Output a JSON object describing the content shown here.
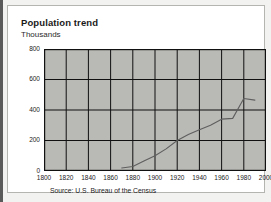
{
  "card": {
    "title": "Population trend",
    "subtitle": "Thousands",
    "source": "Source: U.S. Bureau of the Census"
  },
  "colors": {
    "plot_background": "#b9b9b6",
    "card_background": "#ffffff",
    "page_background": "#f2f2f0",
    "axis": "#111111",
    "grid": "#111111",
    "line": "#5f5f5f",
    "text": "#1a1a1a",
    "left_rule": "#5a5a5a"
  },
  "chart_data": {
    "type": "line",
    "title": "Population trend",
    "subtitle": "Thousands",
    "xlabel": "",
    "ylabel": "Thousands",
    "xlim": [
      1800,
      2000
    ],
    "ylim": [
      0,
      800
    ],
    "xticks": [
      1800,
      1820,
      1840,
      1860,
      1880,
      1900,
      1920,
      1940,
      1960,
      1980,
      2000
    ],
    "yticks": [
      0,
      200,
      400,
      600,
      800
    ],
    "xtick_labels": [
      "1800",
      "1820",
      "1840",
      "1860",
      "1880",
      "1900",
      "1920",
      "1940",
      "1960",
      "1980",
      "2000"
    ],
    "ytick_labels": [
      "0",
      "200",
      "400",
      "600",
      "800"
    ],
    "grid": true,
    "legend": false,
    "source": "Source: U.S. Bureau of the Census",
    "series": [
      {
        "name": "Population",
        "x": [
          1870,
          1880,
          1890,
          1900,
          1910,
          1920,
          1930,
          1940,
          1950,
          1960,
          1970,
          1980,
          1990
        ],
        "y": [
          20,
          30,
          65,
          100,
          145,
          200,
          240,
          270,
          300,
          340,
          345,
          475,
          465
        ]
      }
    ]
  }
}
